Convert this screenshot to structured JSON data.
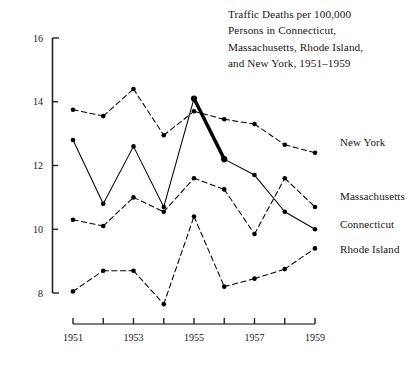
{
  "title": {
    "lines": [
      "Traffic Deaths per 100,000",
      "Persons in Connecticut,",
      "Massachusetts, Rhode Island,",
      "and New York, 1951–1959"
    ]
  },
  "labels": {
    "new_york": "New York",
    "massachusetts": "Massachusetts",
    "connecticut": "Connecticut",
    "rhode_island": "Rhode Island"
  },
  "axes": {
    "y_ticks": [
      "16",
      "14",
      "12",
      "10",
      "8"
    ],
    "x_ticks": [
      "1951",
      "",
      "1953",
      "",
      "1955",
      "",
      "1957",
      "",
      "1959"
    ],
    "x_labeled": [
      "1951",
      "1953",
      "1955",
      "1957",
      "1959"
    ]
  },
  "chart_data": {
    "type": "line",
    "title": "Traffic Deaths per 100,000 Persons in Connecticut, Massachusetts, Rhode Island, and New York, 1951–1959",
    "xlabel": "",
    "ylabel": "",
    "x": [
      1951,
      1952,
      1953,
      1954,
      1955,
      1956,
      1957,
      1958,
      1959
    ],
    "xlim": [
      1951,
      1959
    ],
    "ylim": [
      8,
      16
    ],
    "ytick_values": [
      16,
      14,
      12,
      10,
      8
    ],
    "grid": false,
    "legend": "right-of-plot-inline-labels",
    "highlight": {
      "series": "Connecticut",
      "segment_years": [
        1955,
        1956
      ],
      "style": "bold-thick-stroke",
      "meaning": "Connecticut speed-limit crackdown drop"
    },
    "series": [
      {
        "name": "New York",
        "style": "dashed",
        "color": "#000000",
        "values": [
          13.75,
          13.55,
          14.4,
          12.95,
          13.7,
          13.45,
          13.3,
          12.65,
          12.4
        ]
      },
      {
        "name": "Connecticut",
        "style": "solid",
        "color": "#000000",
        "values": [
          12.8,
          10.8,
          12.6,
          10.7,
          14.1,
          12.2,
          11.7,
          10.55,
          10.0
        ]
      },
      {
        "name": "Massachusetts",
        "style": "dashed",
        "color": "#000000",
        "values": [
          10.3,
          10.1,
          11.0,
          10.55,
          11.6,
          11.25,
          9.85,
          11.6,
          10.7
        ]
      },
      {
        "name": "Rhode Island",
        "style": "dashed",
        "color": "#000000",
        "values": [
          8.05,
          8.7,
          8.7,
          7.65,
          10.4,
          8.2,
          8.45,
          8.75,
          9.4
        ]
      }
    ]
  }
}
